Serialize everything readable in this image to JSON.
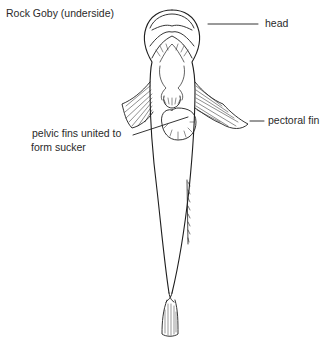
{
  "figure": {
    "title": "Rock Goby (underside)",
    "labels": {
      "head": "head",
      "pectoral_fin": "pectoral fin",
      "sucker_line1": "pelvic fins united to",
      "sucker_line2": "form sucker"
    },
    "colors": {
      "ink": "#1e1e1e",
      "background": "#ffffff"
    }
  }
}
